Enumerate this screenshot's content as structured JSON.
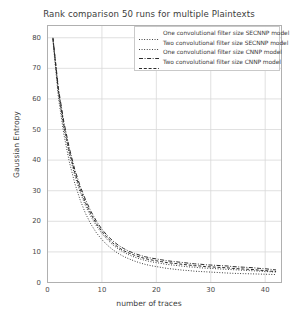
{
  "chart_data": {
    "type": "line",
    "title": "Rank comparison 50 runs for multiple Plaintexts",
    "xlabel": "number of traces",
    "ylabel": "Gaussian Entropy",
    "xlim": [
      0,
      43
    ],
    "ylim": [
      0,
      84
    ],
    "xticks": [
      0,
      10,
      20,
      30,
      40
    ],
    "yticks": [
      0,
      10,
      20,
      30,
      40,
      50,
      60,
      70,
      80
    ],
    "grid": true,
    "legend_position": "upper right",
    "line_color": "#2b2b2b",
    "grid_color": "#d8d8d8",
    "frame_color": "#b0b0b0",
    "background": "#ffffff",
    "x": [
      1,
      2,
      3,
      4,
      5,
      6,
      7,
      8,
      9,
      10,
      11,
      12,
      13,
      14,
      15,
      16,
      17,
      18,
      19,
      20,
      21,
      22,
      23,
      24,
      25,
      26,
      27,
      28,
      29,
      30,
      31,
      32,
      33,
      34,
      35,
      36,
      37,
      38,
      39,
      40,
      41,
      42
    ],
    "series": [
      {
        "name": "One convolutional filter size SECNNP model",
        "style": "dotted",
        "values": [
          79.5,
          62.0,
          50.5,
          42.0,
          35.0,
          29.5,
          25.0,
          21.5,
          18.5,
          16.0,
          14.0,
          12.3,
          11.0,
          9.9,
          9.0,
          8.3,
          7.7,
          7.2,
          6.8,
          6.5,
          6.2,
          5.9,
          5.7,
          5.5,
          5.3,
          5.1,
          5.0,
          4.8,
          4.7,
          4.6,
          4.5,
          4.4,
          4.3,
          4.2,
          4.1,
          4.0,
          3.9,
          3.8,
          3.7,
          3.6,
          3.5,
          3.4
        ]
      },
      {
        "name": "Two convolutional filter size SECNNP model",
        "style": "dotted",
        "values": [
          79.0,
          60.5,
          48.5,
          39.5,
          32.5,
          27.0,
          22.5,
          19.0,
          16.2,
          14.0,
          12.2,
          10.7,
          9.5,
          8.5,
          7.7,
          7.0,
          6.4,
          5.9,
          5.5,
          5.2,
          4.9,
          4.6,
          4.4,
          4.2,
          4.0,
          3.9,
          3.7,
          3.6,
          3.5,
          3.4,
          3.3,
          3.2,
          3.1,
          3.0,
          2.95,
          2.9,
          2.85,
          2.8,
          2.75,
          2.7,
          2.65,
          2.6
        ]
      },
      {
        "name": "One convolutional filter size CNNP model",
        "style": "dashdot",
        "values": [
          80.0,
          63.5,
          52.5,
          44.0,
          37.0,
          31.5,
          27.0,
          23.2,
          20.0,
          17.4,
          15.3,
          13.6,
          12.2,
          11.1,
          10.2,
          9.5,
          8.9,
          8.4,
          8.0,
          7.7,
          7.4,
          7.1,
          6.9,
          6.7,
          6.5,
          6.3,
          6.1,
          6.0,
          5.8,
          5.7,
          5.6,
          5.5,
          5.4,
          5.2,
          5.1,
          5.0,
          4.9,
          4.8,
          4.6,
          4.5,
          4.3,
          4.1
        ]
      },
      {
        "name": "Two convolutional filter size CNNP model",
        "style": "dashed",
        "values": [
          79.8,
          62.8,
          51.5,
          43.0,
          36.0,
          30.5,
          26.0,
          22.3,
          19.2,
          16.7,
          14.6,
          12.9,
          11.5,
          10.4,
          9.6,
          8.9,
          8.3,
          7.8,
          7.4,
          7.1,
          6.8,
          6.5,
          6.3,
          6.1,
          5.9,
          5.7,
          5.5,
          5.4,
          5.2,
          5.1,
          5.0,
          4.9,
          4.8,
          4.6,
          4.5,
          4.4,
          4.3,
          4.2,
          4.0,
          3.9,
          3.7,
          3.6
        ]
      }
    ]
  }
}
